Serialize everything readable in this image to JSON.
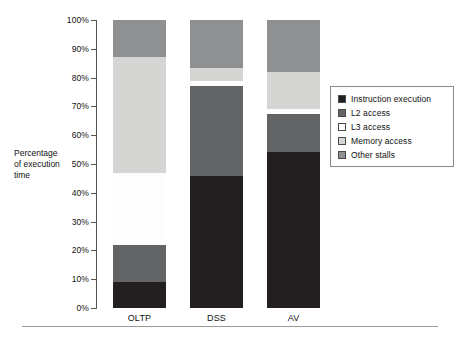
{
  "chart_data": {
    "type": "bar",
    "stacked": true,
    "title": "",
    "xlabel": "",
    "ylabel": "Percentage of execution time",
    "categories": [
      "OLTP",
      "DSS",
      "AV"
    ],
    "ylim": [
      0,
      100
    ],
    "ytick_labels": [
      "0%",
      "10%",
      "20%",
      "30%",
      "40%",
      "50%",
      "60%",
      "70%",
      "80%",
      "90%",
      "100%"
    ],
    "ytick_values": [
      0,
      10,
      20,
      30,
      40,
      50,
      60,
      70,
      80,
      90,
      100
    ],
    "grid": false,
    "legend_position": "right",
    "series": [
      {
        "name": "Instruction execution",
        "color": "#231f20",
        "values": [
          9,
          46,
          54
        ]
      },
      {
        "name": "L2 access",
        "color": "#636466",
        "values": [
          13,
          31,
          13.5
        ]
      },
      {
        "name": "L3 access",
        "color": "#fdfdfd",
        "values": [
          25,
          2,
          1.5
        ]
      },
      {
        "name": "Memory access",
        "color": "#d5d6d3",
        "values": [
          40,
          4.5,
          13
        ]
      },
      {
        "name": "Other stalls",
        "color": "#8e9091",
        "values": [
          13,
          16.5,
          18
        ]
      }
    ]
  },
  "axis": {
    "y_title_line1": "Percentage",
    "y_title_line2": "of execution",
    "y_title_line3": "time"
  }
}
